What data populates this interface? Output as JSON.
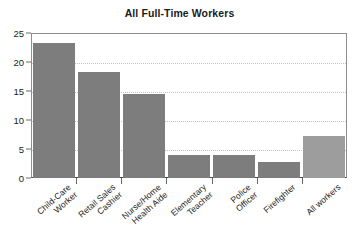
{
  "chart_data": {
    "type": "bar",
    "title": "All Full-Time Workers",
    "xlabel": "",
    "ylabel": "",
    "ylim": [
      0,
      25
    ],
    "yticks": [
      0,
      5,
      10,
      15,
      20,
      25
    ],
    "grid": true,
    "legend": false,
    "categories": [
      "Child-Care Worker",
      "Retail Sales Cashier",
      "Nurse/Home Health Aide",
      "Elementary Teacher",
      "Police Officer",
      "Firefighter",
      "All workers"
    ],
    "category_lines": [
      [
        "Child-Care",
        "Worker"
      ],
      [
        "Retail Sales",
        "Cashier"
      ],
      [
        "Nurse/Home",
        "Health Aide"
      ],
      [
        "Elementary",
        "Teacher"
      ],
      [
        "Police",
        "Officer"
      ],
      [
        "Firefighter"
      ],
      [
        "All workers"
      ]
    ],
    "values": [
      23.3,
      18.3,
      14.4,
      4.0,
      3.9,
      2.8,
      7.3
    ],
    "bar_colors": [
      "#7d7d7d",
      "#7d7d7d",
      "#7d7d7d",
      "#7d7d7d",
      "#7d7d7d",
      "#7d7d7d",
      "#9d9d9d"
    ]
  },
  "style": {
    "background": "#ffffff",
    "title_color": "#1b1b1b",
    "axis_color": "#4a4a4a",
    "frame_color": "#8e8e8e",
    "grid_color": "#bfc3cc",
    "tick_label_color": "#1b1b1b"
  }
}
